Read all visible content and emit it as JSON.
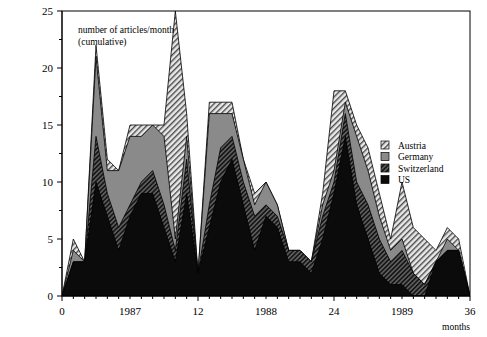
{
  "chart_data": {
    "type": "area",
    "stacked": true,
    "title": "",
    "annotation": "number of articles/month (cumulative)",
    "xlabel": "months",
    "ylabel": "",
    "xlim": [
      0,
      36
    ],
    "ylim": [
      0,
      25
    ],
    "grid": false,
    "x_major_ticks": [
      0,
      12,
      24,
      36
    ],
    "x_major_tick_labels": [
      "0",
      "12",
      "24",
      "36"
    ],
    "x_year_labels": [
      {
        "value": 6,
        "label": "1987"
      },
      {
        "value": 18,
        "label": "1988"
      },
      {
        "value": 30,
        "label": "1989"
      }
    ],
    "x_minor_tick_step": 1,
    "y_major_ticks": [
      0,
      5,
      10,
      15,
      20,
      25
    ],
    "y_major_tick_labels": [
      "0",
      "5",
      "10",
      "15",
      "20",
      "25"
    ],
    "y_minor_tick_step": 2.5,
    "legend_position": "right",
    "x": [
      0,
      1,
      2,
      3,
      4,
      5,
      6,
      7,
      8,
      9,
      10,
      11,
      12,
      13,
      14,
      15,
      16,
      17,
      18,
      19,
      20,
      21,
      22,
      23,
      24,
      25,
      26,
      27,
      28,
      29,
      30,
      31,
      32,
      33,
      34,
      35,
      36
    ],
    "series": [
      {
        "name": "US",
        "fill": "#0b0b0b",
        "pattern": "solid",
        "values": [
          0,
          3,
          3,
          10,
          7,
          4,
          7,
          9,
          9,
          6,
          3,
          9,
          2,
          6,
          10,
          12,
          8,
          4,
          7,
          6,
          3,
          3,
          2,
          5,
          9,
          14,
          8,
          5,
          2,
          1,
          1,
          0,
          0,
          3,
          4,
          4,
          0
        ]
      },
      {
        "name": "Switzerland",
        "fill": "#2e2e2e",
        "pattern": "diagonal-hatch-dark",
        "values": [
          0,
          0,
          0,
          4,
          2,
          2,
          1,
          1,
          2,
          2,
          1,
          3,
          0,
          2,
          3,
          2,
          2,
          3,
          1,
          1,
          1,
          1,
          1,
          2,
          1,
          2,
          2,
          3,
          3,
          2,
          3,
          2,
          1,
          0,
          0,
          0,
          0
        ]
      },
      {
        "name": "Germany",
        "fill": "#7a7a7a",
        "pattern": "solid-gray",
        "values": [
          0,
          1,
          0,
          7,
          2,
          5,
          6,
          4,
          4,
          6,
          1,
          2,
          0,
          8,
          3,
          2,
          2,
          1,
          2,
          1,
          0,
          0,
          0,
          1,
          1,
          1,
          4,
          3,
          2,
          1,
          1,
          0,
          0,
          0,
          1,
          0,
          0
        ]
      },
      {
        "name": "Austria",
        "fill": "#c8c8c8",
        "pattern": "diagonal-hatch-light",
        "values": [
          0,
          1,
          0,
          1,
          1,
          0,
          1,
          1,
          0,
          1,
          20,
          2,
          0,
          1,
          1,
          1,
          0,
          1,
          0,
          0,
          0,
          0,
          0,
          1,
          7,
          1,
          1,
          2,
          2,
          1,
          5,
          4,
          4,
          1,
          1,
          1,
          0
        ]
      }
    ]
  },
  "legend": {
    "items": [
      {
        "label": "Austria"
      },
      {
        "label": "Germany"
      },
      {
        "label": "Switzerland"
      },
      {
        "label": "US"
      }
    ]
  }
}
